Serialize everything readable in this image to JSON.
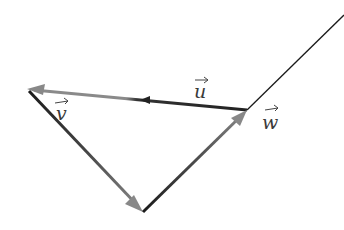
{
  "diagram": {
    "type": "vector-triangle",
    "vertices": {
      "A": {
        "x": 27,
        "y": 89
      },
      "B": {
        "x": 247,
        "y": 110
      },
      "C": {
        "x": 143,
        "y": 212
      },
      "extension_end": {
        "x": 344,
        "y": 15
      }
    },
    "vectors": [
      {
        "name": "u",
        "label": "u",
        "from": "B",
        "to": "A",
        "color": "#555555"
      },
      {
        "name": "v",
        "label": "v",
        "from": "A",
        "to": "C",
        "color": "#555555"
      },
      {
        "name": "w",
        "label": "w",
        "from": "C",
        "to": "B",
        "color": "#555555"
      }
    ],
    "labels": {
      "u": "u",
      "v": "v",
      "w": "w"
    },
    "colors": {
      "line_dark": "#1a1a1a",
      "line_gray": "#808080",
      "background": "#ffffff"
    }
  }
}
